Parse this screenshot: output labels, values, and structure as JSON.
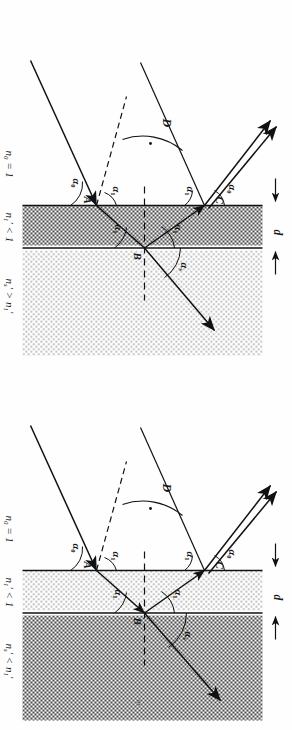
{
  "figure": {
    "caption_marker": "m",
    "domain": "optics-thin-film-refraction-diagram"
  },
  "panels": [
    {
      "id": "panel-top",
      "name": "substrate-denser-than-film",
      "thickness_label": "d",
      "points": {
        "a": "A",
        "b": "B",
        "c": "C"
      },
      "angles": {
        "incident": "α0",
        "reflected_top": "α0",
        "film_a": "α1",
        "film_b_lower": "α1",
        "film_b_upper": "α1",
        "film_c": "α1",
        "substrate": "αs",
        "deviation": "D"
      },
      "angle_parts": {
        "alpha0": {
          "base": "α",
          "sub": "0"
        },
        "alpha1": {
          "base": "α",
          "sub": "1"
        },
        "alphas": {
          "base": "α",
          "sub": "s"
        },
        "D": {
          "base": "D",
          "sub": ""
        }
      },
      "media": [
        {
          "key": "ambient",
          "text": "n0 = 1",
          "sym": "n",
          "sub": "0",
          "prime": false,
          "rel": " = 1"
        },
        {
          "key": "film",
          "text": "n1' < 1",
          "sym": "n",
          "sub": "1",
          "prime": true,
          "rel": " < 1"
        },
        {
          "key": "substrate",
          "text": "ns' > n1'",
          "sym": "n",
          "sub": "s",
          "prime": true,
          "rel": " > ",
          "rel2sym": "n",
          "rel2sub": "1",
          "rel2prime": true
        }
      ],
      "fill": {
        "film": "dense-checker",
        "substrate": "light-dots"
      }
    },
    {
      "id": "panel-bottom",
      "name": "substrate-rarer-than-film",
      "thickness_label": "d",
      "points": {
        "a": "A",
        "b": "B",
        "c": "C"
      },
      "angles": {
        "incident": "α0",
        "reflected_top": "α0",
        "film_a": "α1",
        "film_b_lower": "α1",
        "film_b_upper": "α1",
        "film_c": "α1",
        "substrate": "αs",
        "deviation": "D"
      },
      "angle_parts": {
        "alpha0": {
          "base": "α",
          "sub": "0"
        },
        "alpha1": {
          "base": "α",
          "sub": "1"
        },
        "alphas": {
          "base": "α",
          "sub": "s"
        },
        "D": {
          "base": "D",
          "sub": ""
        }
      },
      "media": [
        {
          "key": "ambient",
          "text": "n0 = 1",
          "sym": "n",
          "sub": "0",
          "prime": false,
          "rel": " = 1"
        },
        {
          "key": "film",
          "text": "n1' < 1",
          "sym": "n",
          "sub": "1",
          "prime": true,
          "rel": " < 1"
        },
        {
          "key": "substrate",
          "text": "ns' < n1'",
          "sym": "n",
          "sub": "s",
          "prime": true,
          "rel": " < ",
          "rel2sym": "n",
          "rel2sub": "1",
          "rel2prime": true
        }
      ],
      "fill": {
        "film": "light-dots",
        "substrate": "dense-checker"
      }
    }
  ],
  "colors": {
    "ink": "#1a1a1a",
    "line": "#111111",
    "dense_fill": "#8e8e8e",
    "light_fill": "#d8d8d8",
    "paper": "#fefefe"
  }
}
